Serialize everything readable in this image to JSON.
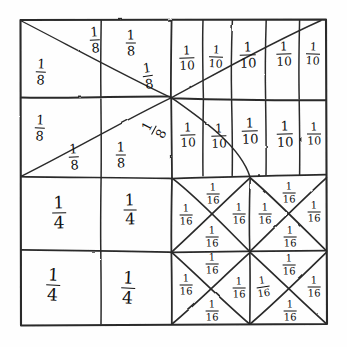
{
  "figure": {
    "kind": "hand-drawn-fraction-square",
    "background_color": "#fefefe",
    "ink_color": "#1a1a1a",
    "outer_square": {
      "x": 20,
      "y": 19,
      "width": 307,
      "height": 306
    }
  },
  "quadrants": [
    {
      "id": "top-left",
      "name": "eighths-quadrant",
      "partition": "8 triangles formed by two diagonals, one vertical and one horizontal line",
      "count": 8,
      "fraction": "1/8"
    },
    {
      "id": "top-right",
      "name": "tenths-quadrant",
      "partition": "2 rows of 5 vertical strips",
      "count": 10,
      "fraction": "1/10"
    },
    {
      "id": "bottom-left",
      "name": "quarters-quadrant",
      "partition": "2 by 2 grid of squares",
      "count": 4,
      "fraction": "1/4"
    },
    {
      "id": "bottom-right",
      "name": "sixteenths-quadrant",
      "partition": "2 by 2 grid of squares, each split by an X into 4 triangles",
      "count": 16,
      "fraction": "1/16"
    }
  ],
  "labels": [
    {
      "id": "e1",
      "numerator": "1",
      "denominator": "8",
      "x": 95,
      "y": 40,
      "size": 13,
      "skew": "sk1",
      "region": "top-left"
    },
    {
      "id": "e2",
      "numerator": "1",
      "denominator": "8",
      "x": 131,
      "y": 43,
      "size": 13,
      "skew": "sk5",
      "region": "top-left"
    },
    {
      "id": "e3",
      "numerator": "1",
      "denominator": "8",
      "x": 41,
      "y": 72,
      "size": 13,
      "skew": "sk2",
      "region": "top-left"
    },
    {
      "id": "e4",
      "numerator": "1",
      "denominator": "8",
      "x": 148,
      "y": 76,
      "size": 13,
      "skew": "sk3",
      "region": "top-left"
    },
    {
      "id": "e5",
      "numerator": "1",
      "denominator": "8",
      "x": 40,
      "y": 128,
      "size": 13,
      "skew": "sk2",
      "region": "top-left"
    },
    {
      "id": "e6",
      "numerator": "1",
      "denominator": "8",
      "x": 154,
      "y": 130,
      "size": 13,
      "skew": "sk6",
      "region": "top-left"
    },
    {
      "id": "e7",
      "numerator": "1",
      "denominator": "8",
      "x": 74,
      "y": 157,
      "size": 13,
      "skew": "sk1",
      "region": "top-left"
    },
    {
      "id": "e8",
      "numerator": "1",
      "denominator": "8",
      "x": 121,
      "y": 155,
      "size": 13,
      "skew": "sk5",
      "region": "top-left"
    },
    {
      "id": "t1",
      "numerator": "1",
      "denominator": "10",
      "x": 187,
      "y": 58,
      "size": 12,
      "skew": "sk5",
      "region": "top-right"
    },
    {
      "id": "t2",
      "numerator": "1",
      "denominator": "10",
      "x": 216,
      "y": 57,
      "size": 11,
      "skew": "sk2",
      "region": "top-right"
    },
    {
      "id": "t3",
      "numerator": "1",
      "denominator": "10",
      "x": 248,
      "y": 55,
      "size": 13,
      "skew": "sk5",
      "region": "top-right"
    },
    {
      "id": "t4",
      "numerator": "1",
      "denominator": "10",
      "x": 284,
      "y": 54,
      "size": 12,
      "skew": "sk5",
      "region": "top-right"
    },
    {
      "id": "t5",
      "numerator": "1",
      "denominator": "10",
      "x": 313,
      "y": 54,
      "size": 11,
      "skew": "sk2",
      "region": "top-right"
    },
    {
      "id": "t6",
      "numerator": "1",
      "denominator": "10",
      "x": 188,
      "y": 135,
      "size": 12,
      "skew": "sk5",
      "region": "top-right"
    },
    {
      "id": "t7",
      "numerator": "1",
      "denominator": "10",
      "x": 219,
      "y": 136,
      "size": 12,
      "skew": "sk5",
      "region": "top-right"
    },
    {
      "id": "t8",
      "numerator": "1",
      "denominator": "10",
      "x": 250,
      "y": 131,
      "size": 13,
      "skew": "sk5",
      "region": "top-right"
    },
    {
      "id": "t9",
      "numerator": "1",
      "denominator": "10",
      "x": 285,
      "y": 134,
      "size": 13,
      "skew": "sk5",
      "region": "top-right"
    },
    {
      "id": "t10",
      "numerator": "1",
      "denominator": "10",
      "x": 314,
      "y": 134,
      "size": 11,
      "skew": "sk5",
      "region": "top-right"
    },
    {
      "id": "q1",
      "numerator": "1",
      "denominator": "4",
      "x": 59,
      "y": 213,
      "size": 17,
      "skew": "sk5",
      "region": "bottom-left"
    },
    {
      "id": "q2",
      "numerator": "1",
      "denominator": "4",
      "x": 130,
      "y": 210,
      "size": 16,
      "skew": "sk5",
      "region": "bottom-left"
    },
    {
      "id": "q3",
      "numerator": "1",
      "denominator": "4",
      "x": 53,
      "y": 285,
      "size": 17,
      "skew": "sk2",
      "region": "bottom-left"
    },
    {
      "id": "q4",
      "numerator": "1",
      "denominator": "4",
      "x": 128,
      "y": 288,
      "size": 17,
      "skew": "sk2",
      "region": "bottom-left"
    },
    {
      "id": "s1",
      "numerator": "1",
      "denominator": "16",
      "x": 213,
      "y": 194,
      "size": 10,
      "skew": "sk5",
      "region": "bottom-right"
    },
    {
      "id": "s2",
      "numerator": "1",
      "denominator": "16",
      "x": 186,
      "y": 215,
      "size": 10,
      "skew": "sk5",
      "region": "bottom-right"
    },
    {
      "id": "s3",
      "numerator": "1",
      "denominator": "16",
      "x": 239,
      "y": 214,
      "size": 10,
      "skew": "sk5",
      "region": "bottom-right"
    },
    {
      "id": "s4",
      "numerator": "1",
      "denominator": "16",
      "x": 212,
      "y": 237,
      "size": 10,
      "skew": "sk5",
      "region": "bottom-right"
    },
    {
      "id": "s5",
      "numerator": "1",
      "denominator": "16",
      "x": 289,
      "y": 193,
      "size": 10,
      "skew": "sk5",
      "region": "bottom-right"
    },
    {
      "id": "s6",
      "numerator": "1",
      "denominator": "16",
      "x": 265,
      "y": 214,
      "size": 10,
      "skew": "sk5",
      "region": "bottom-right"
    },
    {
      "id": "s7",
      "numerator": "1",
      "denominator": "16",
      "x": 314,
      "y": 212,
      "size": 10,
      "skew": "sk5",
      "region": "bottom-right"
    },
    {
      "id": "s8",
      "numerator": "1",
      "denominator": "16",
      "x": 290,
      "y": 237,
      "size": 10,
      "skew": "sk5",
      "region": "bottom-right"
    },
    {
      "id": "s9",
      "numerator": "1",
      "denominator": "16",
      "x": 212,
      "y": 264,
      "size": 10,
      "skew": "sk5",
      "region": "bottom-right"
    },
    {
      "id": "s10",
      "numerator": "1",
      "denominator": "16",
      "x": 186,
      "y": 285,
      "size": 10,
      "skew": "sk5",
      "region": "bottom-right"
    },
    {
      "id": "s11",
      "numerator": "1",
      "denominator": "16",
      "x": 239,
      "y": 288,
      "size": 10,
      "skew": "sk5",
      "region": "bottom-right"
    },
    {
      "id": "s12",
      "numerator": "1",
      "denominator": "16",
      "x": 212,
      "y": 311,
      "size": 10,
      "skew": "sk5",
      "region": "bottom-right"
    },
    {
      "id": "s13",
      "numerator": "1",
      "denominator": "16",
      "x": 289,
      "y": 265,
      "size": 10,
      "skew": "sk5",
      "region": "bottom-right"
    },
    {
      "id": "s14",
      "numerator": "1",
      "denominator": "16",
      "x": 263,
      "y": 287,
      "size": 10,
      "skew": "sk3",
      "region": "bottom-right"
    },
    {
      "id": "s15",
      "numerator": "1",
      "denominator": "16",
      "x": 314,
      "y": 287,
      "size": 10,
      "skew": "sk5",
      "region": "bottom-right"
    },
    {
      "id": "s16",
      "numerator": "1",
      "denominator": "16",
      "x": 290,
      "y": 311,
      "size": 10,
      "skew": "sk5",
      "region": "bottom-right"
    }
  ],
  "strokes": {
    "outer_border": [
      "M20,20 L326,19.5 L327,324 L21,325 Z"
    ],
    "horizontal_mid": [
      "M21,98 L170,96.5 L172,97.5 L326,100.5"
    ],
    "horizontal_upper_quarter": [
      "M21,176 L120,177.5 L171,178.5 L326,174.5"
    ],
    "horizontal_lower_quarter": [
      "M21,249.5 L130,251 L172,252.5 L326,250.5"
    ],
    "vertical_mid": [
      "M171.5,20 L170.5,98 L172,178 L171,252.5 L172,324"
    ],
    "vertical_quarter_left": [
      "M101,20 L100.5,96 L101,178 L100,252 L101,324"
    ],
    "tl_diagonal_a": [
      "M21,21 L171,97.5"
    ],
    "tl_diagonal_b": [
      "M171,97.5 L21,176"
    ],
    "tl_diagonal_c": [
      "M21,176 L171,97.5"
    ],
    "tl_diagonal_d": [
      "M171,97.5 L21,21"
    ],
    "tl_diagonal_e": [
      "M171.5,97.5 L322,20"
    ],
    "tl_diagonal_f": [
      "M171.5,97.5 L171.5,177"
    ],
    "tr_verticals": [
      "M202.5,20 L203.5,98 L203,176",
      "M232,20 L231,98 L232.5,176",
      "M266,20 L265,98.5 L266,175",
      "M299.5,20 L299,99 L300,174.5"
    ],
    "br_vertical_mid": [
      "M250,177 L249,213 L250.5,251 L249.5,288 L250,324"
    ],
    "br_x_cells": [
      "M172,178 L250,251",
      "M250,178 L172,251",
      "M250,178 L327,251",
      "M327,178 L250,251",
      "M172,252 L250,324",
      "M250,252 L172,324",
      "M250,252 L327,324",
      "M327,252 L250,324"
    ]
  }
}
